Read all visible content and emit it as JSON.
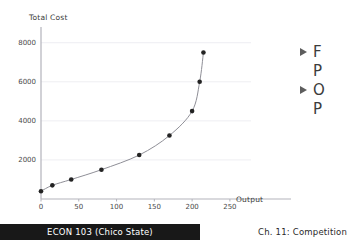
{
  "slide": {
    "footer_course": "ECON 103  (Chico State)",
    "footer_chapter": "Ch. 11: Competition",
    "footer_bar_color": "#181818",
    "background_color": "#ffffff"
  },
  "top_cut_fragments": [
    "—",
    "—",
    "——",
    "—",
    "— —"
  ],
  "bullets": [
    {
      "marker": "triangle-right",
      "text": "F"
    },
    {
      "marker": "none",
      "text": "P"
    },
    {
      "marker": "triangle-right",
      "text": "O"
    },
    {
      "marker": "none",
      "text": "P"
    }
  ],
  "chart_data": {
    "type": "line",
    "title": "",
    "xlabel": "Output",
    "ylabel": "Total Cost",
    "xlim": [
      0,
      270
    ],
    "ylim": [
      0,
      8600
    ],
    "grid": true,
    "grid_color": "#eeeef2",
    "axis_color": "#b3b3bb",
    "line_color": "#8f8f97",
    "marker_color": "#232323",
    "xticks": [
      0,
      50,
      100,
      150,
      200,
      250
    ],
    "yticks": [
      2000,
      4000,
      6000,
      8000
    ],
    "x": [
      0,
      15,
      40,
      80,
      130,
      170,
      200,
      210,
      215
    ],
    "values": [
      400,
      700,
      1000,
      1500,
      2250,
      3250,
      4500,
      6000,
      7500
    ],
    "legend": []
  }
}
